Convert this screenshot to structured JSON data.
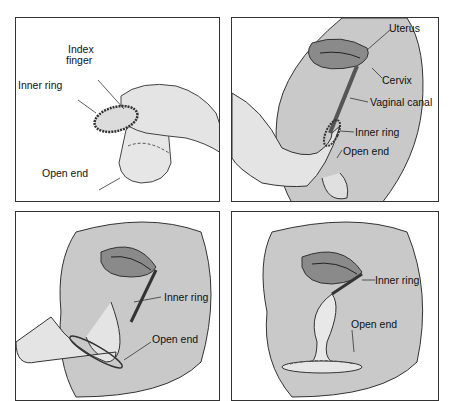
{
  "figure": {
    "panels": [
      {
        "id": "step-1",
        "labels": {
          "index_finger_line1": "Index",
          "index_finger_line2": "finger",
          "inner_ring": "Inner ring",
          "open_end": "Open end"
        }
      },
      {
        "id": "step-2",
        "labels": {
          "uterus": "Uterus",
          "cervix": "Cervix",
          "vaginal_canal": "Vaginal canal",
          "inner_ring": "Inner ring",
          "open_end": "Open end"
        }
      },
      {
        "id": "step-3",
        "labels": {
          "inner_ring": "Inner ring",
          "open_end": "Open end"
        }
      },
      {
        "id": "step-4",
        "labels": {
          "inner_ring": "Inner ring",
          "open_end": "Open end"
        }
      }
    ]
  },
  "colors": {
    "body_fill": "#c9c9c9",
    "uterus_fill": "#8a8a8a",
    "skin_fill": "#e4e4e4",
    "outline": "#333333",
    "border": "#333333"
  }
}
